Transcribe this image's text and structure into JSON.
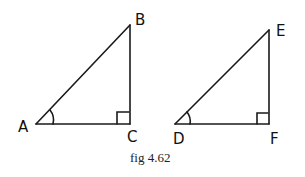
{
  "figure": {
    "caption": "fig 4.62",
    "stroke_color": "#1a1a1a",
    "triangles": [
      {
        "name": "ABC",
        "vertices": {
          "A": {
            "label": "A",
            "x": 36,
            "y": 124
          },
          "B": {
            "label": "B",
            "x": 130,
            "y": 25
          },
          "C": {
            "label": "C",
            "x": 130,
            "y": 124
          }
        },
        "right_angle_at": "C",
        "marked_angle_at": "A"
      },
      {
        "name": "DEF",
        "vertices": {
          "D": {
            "label": "D",
            "x": 175,
            "y": 124
          },
          "E": {
            "label": "E",
            "x": 269,
            "y": 30
          },
          "F": {
            "label": "F",
            "x": 269,
            "y": 124
          }
        },
        "right_angle_at": "F",
        "marked_angle_at": "D"
      }
    ]
  }
}
